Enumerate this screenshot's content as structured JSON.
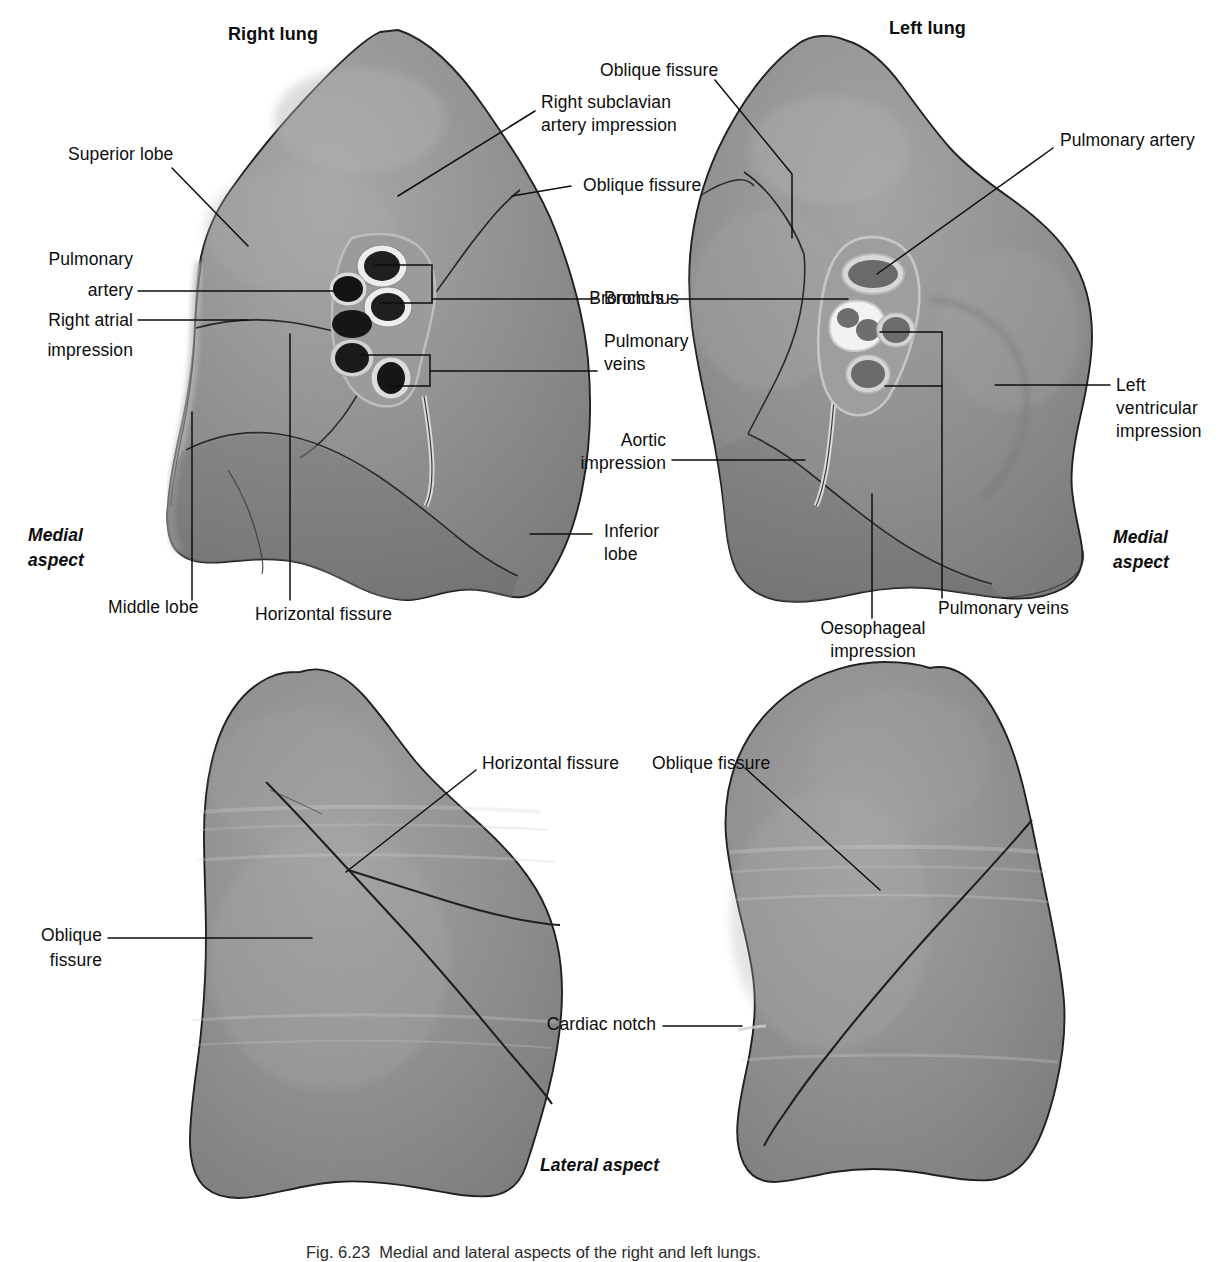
{
  "figure": {
    "type": "anatomical-illustration",
    "background_color": "#ffffff",
    "ink_color": "#111111",
    "tissue_color": "#8d8d8d",
    "tissue_light_color": "#a6a6a6",
    "tissue_dark_color": "#6f6f6f",
    "hilum_ring_color": "#e8e8e8",
    "hilum_lumen_color": "#2a2a2a"
  },
  "panels": {
    "top_left": {
      "title": "Right lung",
      "aspect": "Medial\naspect"
    },
    "top_right": {
      "title": "Left lung",
      "aspect": "Medial\naspect"
    },
    "bottom": {
      "aspect": "Lateral aspect"
    }
  },
  "labels": {
    "right_lung_medial": [
      {
        "id": "superior-lobe",
        "text": "Superior lobe"
      },
      {
        "id": "right-subclavian-artery",
        "text": "Right subclavian\nartery impression"
      },
      {
        "id": "oblique-fissure-right",
        "text": "Oblique fissure"
      },
      {
        "id": "pulmonary-artery-right",
        "text": "Pulmonary\nartery"
      },
      {
        "id": "right-atrial-impression",
        "text": "Right atrial\nimpression"
      },
      {
        "id": "bronchus-right",
        "text": "Bronchus"
      },
      {
        "id": "pulmonary-veins-right",
        "text": "Pulmonary\nveins"
      },
      {
        "id": "middle-lobe",
        "text": "Middle lobe"
      },
      {
        "id": "horizontal-fissure-medial",
        "text": "Horizontal fissure"
      },
      {
        "id": "inferior-lobe",
        "text": "Inferior\nlobe"
      }
    ],
    "left_lung_medial": [
      {
        "id": "oblique-fissure-left-top",
        "text": "Oblique fissure"
      },
      {
        "id": "pulmonary-artery-left",
        "text": "Pulmonary artery"
      },
      {
        "id": "bronchus-left",
        "text": "Bronchus"
      },
      {
        "id": "aortic-impression",
        "text": "Aortic\nimpression"
      },
      {
        "id": "left-ventricular",
        "text": "Left\nventricular\nimpression"
      },
      {
        "id": "pulmonary-veins-left",
        "text": "Pulmonary veins"
      },
      {
        "id": "oesophageal-impression",
        "text": "Oesophageal\nimpression"
      }
    ],
    "right_lung_lateral": [
      {
        "id": "horizontal-fissure-lateral",
        "text": "Horizontal fissure"
      },
      {
        "id": "oblique-fissure-lateral-r",
        "text": "Oblique\nfissure"
      }
    ],
    "left_lung_lateral": [
      {
        "id": "oblique-fissure-lateral-l",
        "text": "Oblique fissure"
      },
      {
        "id": "cardiac-notch",
        "text": "Cardiac notch"
      }
    ]
  },
  "label_text": {
    "superior_lobe": "Superior lobe",
    "right_subclavian_1": "Right subclavian",
    "right_subclavian_2": "artery impression",
    "oblique_fissure": "Oblique fissure",
    "pulmonary_1": "Pulmonary",
    "artery": "artery",
    "right_atrial_1": "Right atrial",
    "right_atrial_2": "impression",
    "bronchus": "Bronchus",
    "pulmonary_veins_1": "Pulmonary",
    "veins": "veins",
    "middle_lobe": "Middle lobe",
    "horizontal_fissure": "Horizontal fissure",
    "inferior_1": "Inferior",
    "inferior_2": "lobe",
    "medial_1": "Medial",
    "medial_2": "aspect",
    "right_lung": "Right lung",
    "left_lung": "Left lung",
    "pulmonary_artery": "Pulmonary artery",
    "aortic_1": "Aortic",
    "aortic_2": "impression",
    "left_vent_1": "Left",
    "left_vent_2": "ventricular",
    "left_vent_3": "impression",
    "pulmonary_veins_full": "Pulmonary veins",
    "oesophageal_1": "Oesophageal",
    "oesophageal_2": "impression",
    "oblique_1": "Oblique",
    "oblique_2": "fissure",
    "cardiac_notch": "Cardiac notch",
    "lateral_aspect": "Lateral aspect",
    "caption": "Fig. 6.23  Medial and lateral aspects of the right and left lungs."
  }
}
